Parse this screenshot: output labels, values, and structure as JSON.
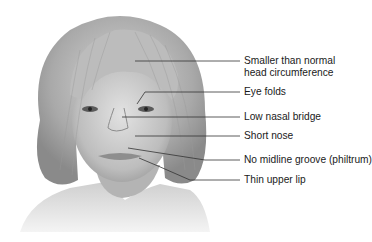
{
  "figure": {
    "style": "grayscale",
    "labels": [
      {
        "id": "head",
        "lines": [
          "Smaller than normal",
          "head circumference"
        ]
      },
      {
        "id": "eye-folds",
        "lines": [
          "Eye folds"
        ]
      },
      {
        "id": "nasal-bridge",
        "lines": [
          "Low nasal bridge"
        ]
      },
      {
        "id": "short-nose",
        "lines": [
          "Short nose"
        ]
      },
      {
        "id": "philtrum",
        "lines": [
          "No midline groove (philtrum)"
        ]
      },
      {
        "id": "upper-lip",
        "lines": [
          "Thin upper lip"
        ]
      }
    ],
    "colors": {
      "text": "#1a1a1a",
      "leader": "#333333",
      "background": "#ffffff"
    }
  }
}
